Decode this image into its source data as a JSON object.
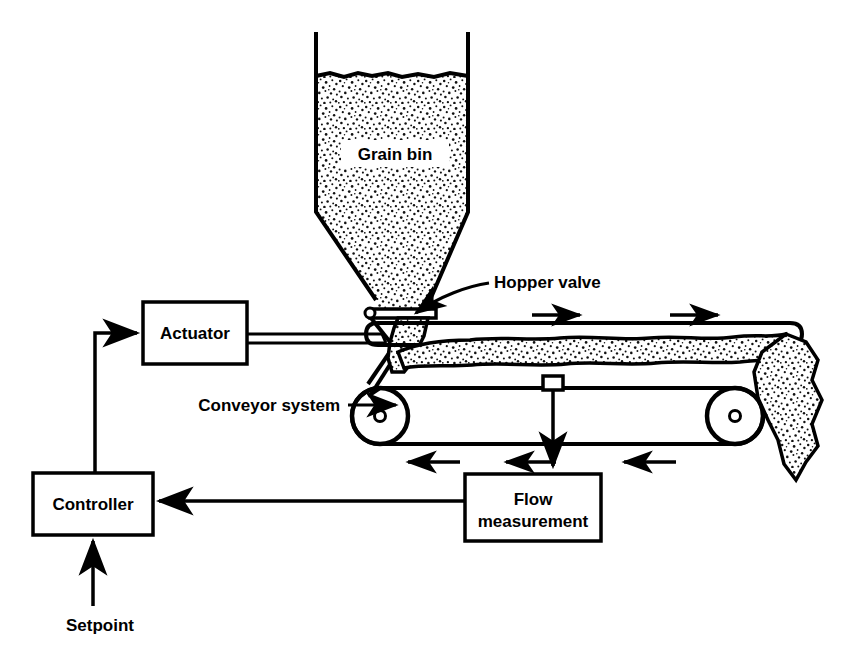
{
  "diagram": {
    "background_color": "#ffffff",
    "line_color": "#000000",
    "labels": {
      "grain_bin": "Grain bin",
      "hopper_valve": "Hopper valve",
      "actuator": "Actuator",
      "conveyor_system": "Conveyor system",
      "flow_measurement_line1": "Flow",
      "flow_measurement_line2": "measurement",
      "controller": "Controller",
      "setpoint": "Setpoint"
    },
    "blocks": [
      {
        "name": "actuator",
        "label": "Actuator",
        "x": 143,
        "y": 302,
        "width": 104,
        "height": 62
      },
      {
        "name": "controller",
        "label": "Controller",
        "x": 33,
        "y": 473,
        "width": 120,
        "height": 62
      },
      {
        "name": "flow-measurement",
        "label": "Flow measurement",
        "x": 465,
        "y": 474,
        "width": 136,
        "height": 67
      }
    ],
    "callouts": [
      {
        "name": "grain-bin",
        "text": "Grain bin",
        "x": 395,
        "y": 160
      },
      {
        "name": "hopper-valve",
        "text": "Hopper valve",
        "x": 494,
        "y": 288
      },
      {
        "name": "conveyor-system",
        "text": "Conveyor system",
        "x": 279,
        "y": 410
      },
      {
        "name": "setpoint",
        "text": "Setpoint",
        "x": 66,
        "y": 625
      }
    ],
    "flow_arrows": {
      "belt_top_direction": "right",
      "belt_return_direction": "left",
      "belt_top_arrow_count": 2,
      "belt_return_arrow_count": 3
    },
    "signals": [
      {
        "name": "controller-to-actuator",
        "from": "Controller",
        "to": "Actuator"
      },
      {
        "name": "flow-to-controller",
        "from": "Flow measurement",
        "to": "Controller"
      },
      {
        "name": "setpoint-to-controller",
        "from": "Setpoint",
        "to": "Controller"
      },
      {
        "name": "belt-to-flow",
        "from": "Conveyor system",
        "to": "Flow measurement"
      }
    ]
  }
}
